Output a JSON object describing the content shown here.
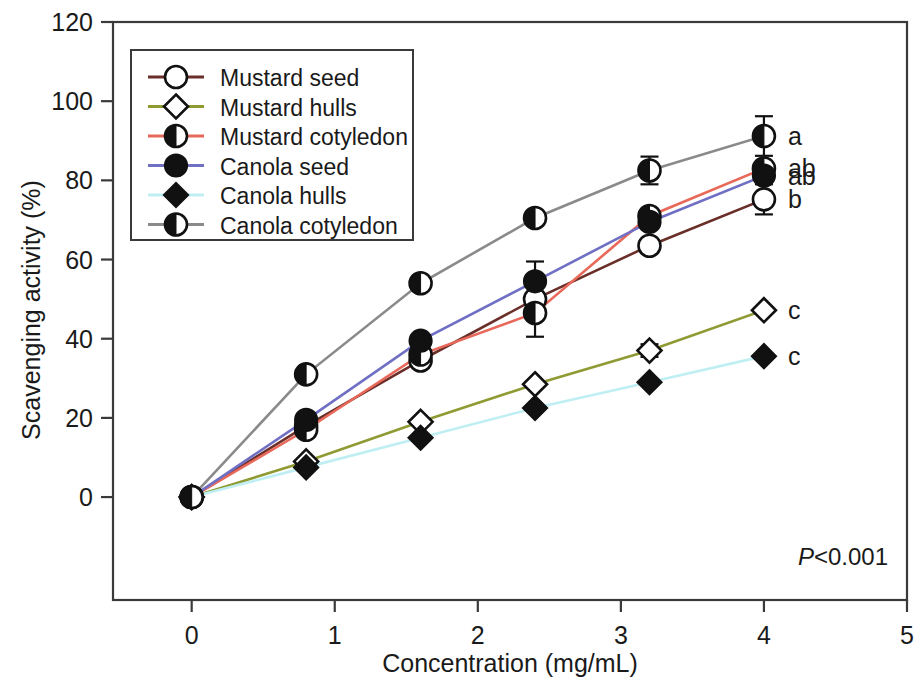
{
  "chart_data": {
    "type": "line",
    "title": "",
    "xlabel": "Concentration (mg/mL)",
    "ylabel": "Scavenging activity (%)",
    "xlim": [
      -0.55,
      5.0
    ],
    "ylim": [
      -26,
      120
    ],
    "xticks": [
      0,
      1,
      2,
      3,
      4,
      5
    ],
    "xticklabels": [
      "0",
      "1",
      "2",
      "3",
      "4",
      "5"
    ],
    "yticks": [
      0,
      20,
      40,
      60,
      80,
      100,
      120
    ],
    "yticklabels": [
      "0",
      "20",
      "40",
      "60",
      "80",
      "100",
      "120"
    ],
    "grid": false,
    "legend_position": "upper left",
    "x": [
      0,
      0.8,
      1.6,
      2.4,
      3.2,
      4.0
    ],
    "series": [
      {
        "name": "Mustard seed",
        "color": "#6b2f2a",
        "marker": "open-circle",
        "values": [
          0,
          18.0,
          34.5,
          50.0,
          63.5,
          75.2
        ],
        "errors": [
          0,
          2.2,
          1.8,
          9.5,
          0,
          3.8
        ],
        "end_letter": "b"
      },
      {
        "name": "Mustard hulls",
        "color": "#8f9a33",
        "marker": "open-diamond",
        "values": [
          0,
          9.0,
          19.0,
          28.5,
          37.0,
          47.2
        ],
        "errors": [
          0,
          0,
          0,
          0,
          1.6,
          0
        ],
        "end_letter": "c"
      },
      {
        "name": "Mustard cotyledon",
        "color": "#e8695a",
        "marker": "half-circle",
        "values": [
          0,
          17.0,
          36.0,
          46.5,
          71.0,
          83.0
        ],
        "errors": [
          0,
          0,
          0,
          0,
          0,
          0
        ],
        "end_letter": "ab"
      },
      {
        "name": "Canola seed",
        "color": "#6f6fc4",
        "marker": "filled-circle",
        "values": [
          0,
          19.5,
          39.5,
          54.5,
          69.5,
          81.2
        ],
        "errors": [
          0,
          0,
          0,
          0,
          0,
          0
        ],
        "end_letter": "ab"
      },
      {
        "name": "Canola hulls",
        "color": "#bfeef3",
        "marker": "filled-diamond",
        "values": [
          0,
          7.5,
          15.0,
          22.5,
          29.0,
          35.6
        ],
        "errors": [
          0,
          0,
          0,
          0,
          0,
          0
        ],
        "end_letter": "c"
      },
      {
        "name": "Canola cotyledon",
        "color": "#8a8a8a",
        "marker": "half-circle-dark",
        "values": [
          0,
          31.0,
          54.0,
          70.5,
          82.5,
          91.2
        ],
        "errors": [
          0,
          1.6,
          0,
          1.5,
          3.5,
          5.0
        ],
        "end_letter": "a"
      }
    ],
    "annotations": [
      {
        "text": "P<0.001",
        "italic_prefix": "P",
        "rest": "<0.001"
      }
    ]
  },
  "legend": {
    "items": [
      {
        "label": "Mustard seed"
      },
      {
        "label": "Mustard hulls"
      },
      {
        "label": "Mustard cotyledon"
      },
      {
        "label": "Canola seed"
      },
      {
        "label": "Canola hulls"
      },
      {
        "label": "Canola cotyledon"
      }
    ]
  },
  "axes": {
    "x_title": "Concentration (mg/mL)",
    "y_title": "Scavenging activity (%)"
  },
  "pvalue": {
    "italic": "P",
    "text": "<0.001"
  },
  "significance_letters": {
    "a": "a",
    "ab1": "ab",
    "ab2": "ab",
    "b": "b",
    "c1": "c",
    "c2": "c"
  }
}
